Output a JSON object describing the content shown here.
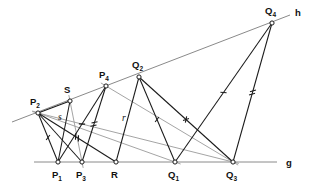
{
  "figure": {
    "type": "geometric-construction",
    "title": "",
    "width": 317,
    "height": 188,
    "background": "#ffffff",
    "colors": {
      "baseline": "#8a8a8a",
      "construction_line": "#9a9a9a",
      "segment": "#1a1a1a",
      "point_stroke": "#1a1a1a",
      "point_fill": "#ffffff",
      "text": "#111111"
    }
  },
  "lines": [
    {
      "id": "g",
      "label": "g",
      "role": "baseline",
      "x1": 34,
      "y1": 162,
      "x2": 277,
      "y2": 162,
      "label_x": 286,
      "label_y": 166,
      "color": "#8a8a8a"
    },
    {
      "id": "h",
      "label": "h",
      "role": "oblique-line",
      "x1": 12,
      "y1": 122,
      "x2": 290,
      "y2": 15,
      "label_x": 295,
      "label_y": 16,
      "color": "#8a8a8a"
    }
  ],
  "points": [
    {
      "id": "P1",
      "base": "P",
      "sub": "1",
      "x": 58,
      "y": 162,
      "label_x": 52,
      "label_y": 178,
      "on": "g"
    },
    {
      "id": "P2",
      "base": "P",
      "sub": "2",
      "x": 38,
      "y": 113,
      "label_x": 30,
      "label_y": 105,
      "on": "h"
    },
    {
      "id": "P3",
      "base": "P",
      "sub": "3",
      "x": 82,
      "y": 162,
      "label_x": 76,
      "label_y": 178,
      "on": "g"
    },
    {
      "id": "P4",
      "base": "P",
      "sub": "4",
      "x": 106,
      "y": 86,
      "label_x": 99,
      "label_y": 78,
      "on": "h"
    },
    {
      "id": "Q1",
      "base": "Q",
      "sub": "1",
      "x": 175,
      "y": 162,
      "label_x": 168,
      "label_y": 178,
      "on": "g"
    },
    {
      "id": "Q2",
      "base": "Q",
      "sub": "2",
      "x": 139,
      "y": 77,
      "label_x": 132,
      "label_y": 68,
      "on": "h"
    },
    {
      "id": "Q3",
      "base": "Q",
      "sub": "3",
      "x": 233,
      "y": 162,
      "label_x": 226,
      "label_y": 178,
      "on": "g"
    },
    {
      "id": "Q4",
      "base": "Q",
      "sub": "4",
      "x": 272,
      "y": 23,
      "label_x": 265,
      "label_y": 14,
      "on": "h"
    },
    {
      "id": "R",
      "base": "R",
      "sub": "",
      "x": 116,
      "y": 162,
      "label_x": 111,
      "label_y": 178,
      "on": "g"
    },
    {
      "id": "S",
      "base": "S",
      "sub": "",
      "x": 70,
      "y": 101,
      "label_x": 64,
      "label_y": 93,
      "on": "h"
    }
  ],
  "segments": [
    {
      "id": "P2-P1",
      "from": "P2",
      "to": "P1",
      "ticks": 1,
      "tick_style": "slash"
    },
    {
      "id": "P2-P3",
      "from": "P2",
      "to": "P3",
      "ticks": 0,
      "tick_style": "none"
    },
    {
      "id": "P2-S",
      "from": "P2",
      "to": "S",
      "ticks": 0,
      "tick_style": "none"
    },
    {
      "id": "P1-S",
      "from": "P1",
      "to": "S",
      "ticks": 0,
      "tick_style": "none"
    },
    {
      "id": "P1-P4",
      "from": "P1",
      "to": "P4",
      "ticks": 1,
      "tick_style": "slash"
    },
    {
      "id": "P3-P4",
      "from": "P3",
      "to": "P4",
      "ticks": 2,
      "tick_style": "double"
    },
    {
      "id": "P2-R",
      "from": "P2",
      "to": "R",
      "ticks": 2,
      "tick_style": "double"
    },
    {
      "id": "R-Q2",
      "from": "R",
      "to": "Q2",
      "ticks": 0,
      "tick_style": "none"
    },
    {
      "id": "Q2-Q1",
      "from": "Q2",
      "to": "Q1",
      "ticks": 1,
      "tick_style": "slash"
    },
    {
      "id": "Q2-Q3",
      "from": "Q2",
      "to": "Q3",
      "ticks": 1,
      "tick_style": "cross"
    },
    {
      "id": "Q1-Q4",
      "from": "Q1",
      "to": "Q4",
      "ticks": 1,
      "tick_style": "slash"
    },
    {
      "id": "Q3-Q4",
      "from": "Q3",
      "to": "Q4",
      "ticks": 2,
      "tick_style": "double"
    }
  ],
  "construction_lines": [
    {
      "id": "par-1",
      "from": "P2",
      "to": "Q1",
      "color": "#9a9a9a"
    },
    {
      "id": "par-2",
      "from": "P2",
      "to": "Q3",
      "color": "#9a9a9a"
    },
    {
      "id": "par-3",
      "from": "S",
      "to": "P3",
      "color": "#9a9a9a"
    },
    {
      "id": "par-4",
      "from": "P4",
      "to": "Q3",
      "color": "#9a9a9a"
    }
  ],
  "segment_labels": [
    {
      "id": "label-s",
      "text": "s",
      "x": 58,
      "y": 120
    },
    {
      "id": "label-r",
      "text": "r",
      "x": 122,
      "y": 121
    }
  ]
}
